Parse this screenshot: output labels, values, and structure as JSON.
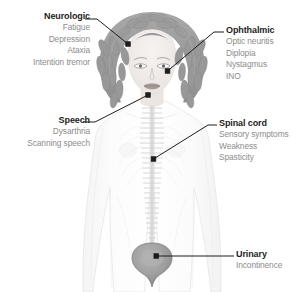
{
  "figure": {
    "colors": {
      "background": "#ffffff",
      "hair": "#9b9b9b",
      "hair_dark": "#868686",
      "hair_light": "#b4b4b4",
      "skin": "#f1ece9",
      "body_outline": "#e3e3e3",
      "spine": "#d5d5d5",
      "spine_dark": "#c4c4c4",
      "bladder": "#a0a0a0",
      "bladder_dark": "#8b8b8b",
      "leader_line": "#1d1d1d",
      "title_text": "#1d1d1d",
      "item_text": "#8d8d8d"
    }
  },
  "callouts": [
    {
      "id": "neurologic",
      "title": "Neurologic",
      "items": [
        "Fatigue",
        "Depression",
        "Ataxia",
        "Intention tremor"
      ],
      "align": "right",
      "anchor_target": "head-hair"
    },
    {
      "id": "ophthalmic",
      "title": "Ophthalmic",
      "items": [
        "Optic neuritis",
        "Diplopia",
        "Nystagmus",
        "INO"
      ],
      "align": "left",
      "anchor_target": "eye"
    },
    {
      "id": "speech",
      "title": "Speech",
      "items": [
        "Dysarthria",
        "Scanning speech"
      ],
      "align": "right",
      "anchor_target": "mouth"
    },
    {
      "id": "spinal-cord",
      "title": "Spinal cord",
      "items": [
        "Sensory symptoms",
        "Weakness",
        "Spasticity"
      ],
      "align": "left",
      "anchor_target": "vertebral-column"
    },
    {
      "id": "urinary",
      "title": "Urinary",
      "items": [
        "Incontinence"
      ],
      "align": "left",
      "anchor_target": "bladder"
    }
  ]
}
